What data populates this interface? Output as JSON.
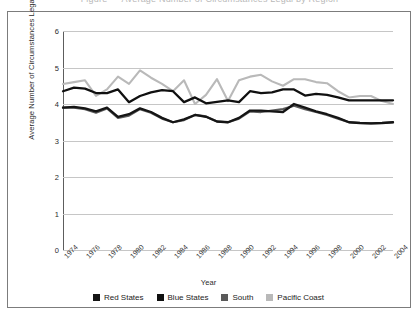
{
  "caption": "Figure — Average Number of Circumstances Legal by Region",
  "chart_data": {
    "type": "line",
    "title": "",
    "xlabel": "Year",
    "ylabel": "Average Number of Circumstances Legal",
    "ylim": [
      0,
      6
    ],
    "yticks": [
      0,
      1,
      2,
      3,
      4,
      5,
      6
    ],
    "xlim": [
      1974,
      2004
    ],
    "xticks": [
      1974,
      1976,
      1978,
      1980,
      1982,
      1984,
      1986,
      1988,
      1990,
      1992,
      1994,
      1996,
      1998,
      2000,
      2002,
      2004
    ],
    "grid": true,
    "legend_position": "bottom",
    "x": [
      1974,
      1975,
      1976,
      1977,
      1978,
      1979,
      1980,
      1981,
      1982,
      1983,
      1984,
      1985,
      1986,
      1987,
      1988,
      1989,
      1990,
      1991,
      1992,
      1993,
      1994,
      1995,
      1996,
      1997,
      1998,
      1999,
      2000,
      2001,
      2002,
      2003,
      2004
    ],
    "series": [
      {
        "name": "Red States",
        "color": "#151515",
        "values": [
          3.9,
          3.92,
          3.88,
          3.8,
          3.9,
          3.65,
          3.72,
          3.88,
          3.78,
          3.62,
          3.5,
          3.58,
          3.7,
          3.65,
          3.52,
          3.5,
          3.62,
          3.82,
          3.82,
          3.8,
          3.78,
          4.0,
          3.9,
          3.8,
          3.72,
          3.62,
          3.5,
          3.48,
          3.47,
          3.48,
          3.5
        ]
      },
      {
        "name": "Blue States",
        "color": "#101010",
        "values": [
          4.35,
          4.45,
          4.42,
          4.3,
          4.3,
          4.4,
          4.05,
          4.22,
          4.32,
          4.38,
          4.35,
          4.05,
          4.18,
          4.02,
          4.06,
          4.1,
          4.05,
          4.35,
          4.3,
          4.32,
          4.4,
          4.4,
          4.23,
          4.28,
          4.25,
          4.18,
          4.1,
          4.1,
          4.1,
          4.1,
          4.1
        ]
      },
      {
        "name": "South",
        "color": "#5a5a5a",
        "values": [
          3.9,
          3.9,
          3.86,
          3.76,
          3.88,
          3.62,
          3.68,
          3.86,
          3.76,
          3.6,
          3.5,
          3.56,
          3.7,
          3.66,
          3.52,
          3.5,
          3.6,
          3.8,
          3.78,
          3.82,
          3.86,
          3.95,
          3.86,
          3.78,
          3.7,
          3.6,
          3.5,
          3.48,
          3.47,
          3.48,
          3.5
        ]
      },
      {
        "name": "Pacific Coast",
        "color": "#b9b9b9",
        "values": [
          4.55,
          4.6,
          4.65,
          4.22,
          4.4,
          4.75,
          4.55,
          4.92,
          4.72,
          4.55,
          4.35,
          4.65,
          4.0,
          4.25,
          4.68,
          4.08,
          4.65,
          4.75,
          4.8,
          4.62,
          4.5,
          4.68,
          4.68,
          4.6,
          4.57,
          4.35,
          4.18,
          4.22,
          4.22,
          4.08,
          4.0
        ]
      }
    ]
  },
  "legend": {
    "items": [
      {
        "label": "Red States",
        "color": "#151515"
      },
      {
        "label": "Blue States",
        "color": "#101010"
      },
      {
        "label": "South",
        "color": "#5a5a5a"
      },
      {
        "label": "Pacific Coast",
        "color": "#b9b9b9"
      }
    ]
  }
}
